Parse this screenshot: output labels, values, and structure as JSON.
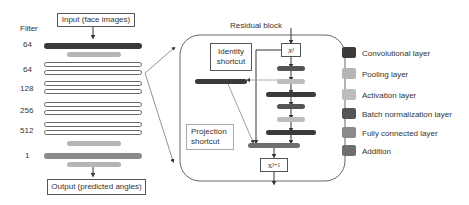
{
  "colors": {
    "convolutional": "#3a3a3a",
    "pooling": "#b5b5b5",
    "activation": "#bdbdbd",
    "batch_norm": "#555555",
    "fully_connected": "#8a8a8a",
    "addition": "#6e6e6e"
  },
  "network": {
    "filter_header": "Filter",
    "input_label": "Input (face images)",
    "output_label": "Output (predicted angles)",
    "filters": [
      "64",
      "64",
      "128",
      "256",
      "512",
      "1"
    ]
  },
  "residual": {
    "title": "Residual block",
    "identity_label": "Identity shortcut",
    "projection_label": "Projection shortcut",
    "x_in": "x",
    "x_in_sub": "l",
    "x_out": "x",
    "x_out_sub": "l+1"
  },
  "legend": [
    {
      "label": "Convolutional layer",
      "key": "convolutional"
    },
    {
      "label": "Pooling layer",
      "key": "pooling"
    },
    {
      "label": "Activation layer",
      "key": "activation"
    },
    {
      "label": "Batch normalization layer",
      "key": "batch_norm"
    },
    {
      "label": "Fully connected layer",
      "key": "fully_connected"
    },
    {
      "label": "Addition",
      "key": "addition"
    }
  ]
}
